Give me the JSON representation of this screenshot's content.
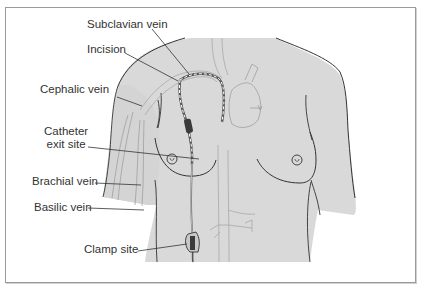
{
  "figure": {
    "colors": {
      "skin": "#d9d9d9",
      "outline": "#333333",
      "vessel": "#a8a8a8",
      "frame": "#9a9a9a",
      "catheter_cuff": "#3a3a3a"
    },
    "labels": {
      "subclavian_vein": "Subclavian vein",
      "incision": "Incision",
      "cephalic_vein": "Cephalic vein",
      "catheter_exit_line1": "Catheter",
      "catheter_exit_line2": "exit site",
      "brachial_vein": "Brachial vein",
      "basilic_vein": "Basilic vein",
      "clamp_site": "Clamp site"
    }
  }
}
